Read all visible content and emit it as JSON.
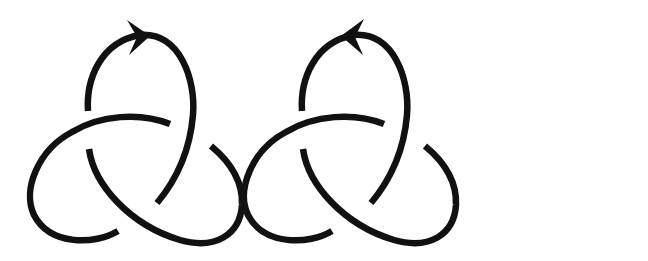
{
  "figure": {
    "stroke_color": "#111111",
    "background_color": "#ffffff",
    "knots": [
      {
        "id": "left",
        "label": "Trefoil knot, orientation arrow pointing right",
        "arrow_direction": "right",
        "crossings": 3
      },
      {
        "id": "right",
        "label": "Trefoil knot, orientation arrow pointing left",
        "arrow_direction": "left",
        "crossings": 3
      }
    ]
  }
}
